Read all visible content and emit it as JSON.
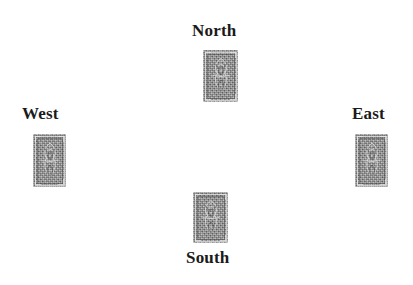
{
  "canvas": {
    "width": 413,
    "height": 285,
    "background": "#ffffff"
  },
  "style": {
    "label_color": "#1a1a1a",
    "card_base_color": "#8a8a8a",
    "card_pattern_light": "#e1e1e1",
    "card_pattern_dark": "#4a4a4a"
  },
  "diagram": {
    "type": "bridge-compass-layout",
    "seats": [
      {
        "id": "north",
        "label": "North",
        "label_position": "above",
        "label_x": 192,
        "label_y": 22,
        "card": {
          "name": "card-back",
          "face": "down",
          "x": 203,
          "y": 50,
          "width": 35,
          "height": 52
        }
      },
      {
        "id": "west",
        "label": "West",
        "label_position": "above",
        "label_x": 22,
        "label_y": 105,
        "card": {
          "name": "card-back",
          "face": "down",
          "x": 33,
          "y": 134,
          "width": 33,
          "height": 53
        }
      },
      {
        "id": "east",
        "label": "East",
        "label_position": "above",
        "label_x": 352,
        "label_y": 105,
        "card": {
          "name": "card-back",
          "face": "down",
          "x": 355,
          "y": 134,
          "width": 33,
          "height": 53
        }
      },
      {
        "id": "south",
        "label": "South",
        "label_position": "below",
        "label_x": 186,
        "label_y": 249,
        "card": {
          "name": "card-back",
          "face": "down",
          "x": 193,
          "y": 192,
          "width": 35,
          "height": 51
        }
      }
    ]
  }
}
